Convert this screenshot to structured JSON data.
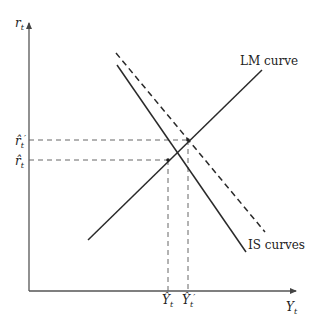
{
  "diagram": {
    "axes": {
      "y_label": "r",
      "y_label_sub": "t",
      "x_label": "Y",
      "x_label_sub": "t"
    },
    "curves": {
      "lm_label": "LM curve",
      "is_label": "IS curves"
    },
    "equilibria": {
      "r_hat": "r̂",
      "r_hat_sub": "t",
      "r_hat_prime": "r̂",
      "r_hat_prime_sub": "t",
      "prime": "′",
      "y_hat": "Ŷ",
      "y_hat_sub": "t",
      "y_hat_prime": "Ŷ",
      "y_hat_prime_sub": "t"
    },
    "colors": {
      "line": "#2a2a2a",
      "axis": "#555555",
      "dashed": "#666666"
    }
  }
}
